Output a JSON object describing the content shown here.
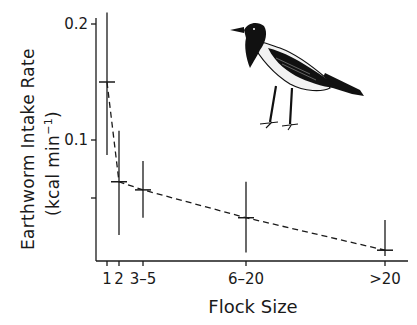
{
  "chart_data": {
    "type": "line",
    "title": "",
    "xlabel": "Flock Size",
    "ylabel": "Earthworm Intake Rate",
    "ylabel_units": "(kcal min",
    "ylabel_units_sup": "−1",
    "ylabel_units_close": ")",
    "categories": [
      "1",
      "2",
      "3–5",
      "6–20",
      ">20"
    ],
    "x_positions": [
      107,
      119,
      143,
      246,
      385
    ],
    "series": [
      {
        "name": "Earthworm intake rate",
        "style": "dashed",
        "values": [
          0.15,
          0.064,
          0.057,
          0.033,
          0.005
        ],
        "error_low": [
          0.087,
          0.018,
          0.033,
          0.003,
          0.0
        ],
        "error_high": [
          0.21,
          0.108,
          0.082,
          0.064,
          0.031
        ]
      }
    ],
    "yticks": [
      {
        "value": 0.2,
        "label": "0.2"
      },
      {
        "value": 0.1,
        "label": "0.1"
      },
      {
        "value": 0.05,
        "label": ""
      }
    ],
    "ylim": [
      0,
      0.22
    ],
    "grid": false,
    "legend": "none",
    "annotation": "hooded crow illustration"
  }
}
